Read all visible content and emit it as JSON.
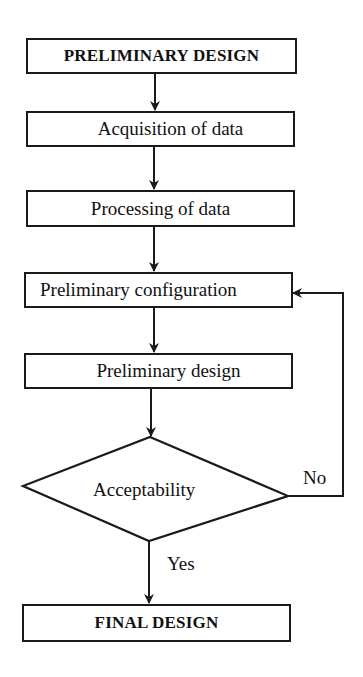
{
  "diagram": {
    "type": "flowchart",
    "nodes": [
      {
        "id": "start",
        "shape": "rect",
        "label": "PRELIMINARY DESIGN",
        "bold": true
      },
      {
        "id": "acq",
        "shape": "rect",
        "label": "Acquisition of data"
      },
      {
        "id": "proc",
        "shape": "rect",
        "label": "Processing of data"
      },
      {
        "id": "config",
        "shape": "rect",
        "label": "Preliminary configuration"
      },
      {
        "id": "prelim",
        "shape": "rect",
        "label": "Preliminary design"
      },
      {
        "id": "decision",
        "shape": "diamond",
        "label": "Acceptability"
      },
      {
        "id": "final",
        "shape": "rect",
        "label": "FINAL DESIGN",
        "bold": true
      }
    ],
    "edges": [
      {
        "from": "start",
        "to": "acq",
        "label": ""
      },
      {
        "from": "acq",
        "to": "proc",
        "label": ""
      },
      {
        "from": "proc",
        "to": "config",
        "label": ""
      },
      {
        "from": "config",
        "to": "prelim",
        "label": ""
      },
      {
        "from": "prelim",
        "to": "decision",
        "label": ""
      },
      {
        "from": "decision",
        "to": "final",
        "label": "Yes"
      },
      {
        "from": "decision",
        "to": "config",
        "label": "No"
      }
    ],
    "labels": {
      "yes": "Yes",
      "no": "No"
    }
  }
}
